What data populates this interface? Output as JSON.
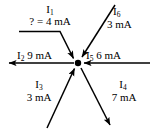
{
  "diagram": {
    "type": "current-junction-node-diagram",
    "background_color": "#ffffff",
    "line_color": "#000000",
    "node": {
      "label": "junction-node",
      "x": 78,
      "y": 63,
      "radius": 3.2
    },
    "unknown_marker": "?",
    "unit": "mA",
    "branches": [
      {
        "id": "I1",
        "symbol": "I",
        "subscript": "1",
        "value_text": "? = 4 mA",
        "value": 4,
        "unit": "mA",
        "known": false,
        "direction": "into-node",
        "orientation": "bent-from-upper-left"
      },
      {
        "id": "I2",
        "symbol": "I",
        "subscript": "2",
        "value_text": "9 mA",
        "value": 9,
        "unit": "mA",
        "known": true,
        "direction": "out-of-node",
        "orientation": "left"
      },
      {
        "id": "I3",
        "symbol": "I",
        "subscript": "3",
        "value_text": "3 mA",
        "value": 3,
        "unit": "mA",
        "known": true,
        "direction": "into-node",
        "orientation": "lower-left"
      },
      {
        "id": "I4",
        "symbol": "I",
        "subscript": "4",
        "value_text": "7 mA",
        "value": 7,
        "unit": "mA",
        "known": true,
        "direction": "out-of-node",
        "orientation": "lower-right"
      },
      {
        "id": "I5",
        "symbol": "I",
        "subscript": "5",
        "value_text": "6 mA",
        "value": 6,
        "unit": "mA",
        "known": true,
        "direction": "into-node",
        "orientation": "right"
      },
      {
        "id": "I6",
        "symbol": "I",
        "subscript": "6",
        "value_text": "3 mA",
        "value": 3,
        "unit": "mA",
        "known": true,
        "direction": "into-node",
        "orientation": "upper-right"
      }
    ],
    "labels": {
      "i1_symbol": "I",
      "i1_sub": "1",
      "i1_value": "? = 4 mA",
      "i2_symbol": "I",
      "i2_sub": "2",
      "i2_value": "9 mA",
      "i3_symbol": "I",
      "i3_sub": "3",
      "i3_value": "3 mA",
      "i4_symbol": "I",
      "i4_sub": "4",
      "i4_value": "7 mA",
      "i5_symbol": "I",
      "i5_sub": "5",
      "i5_value": "6 mA",
      "i6_symbol": "I",
      "i6_sub": "6",
      "i6_value": "3 mA"
    }
  }
}
